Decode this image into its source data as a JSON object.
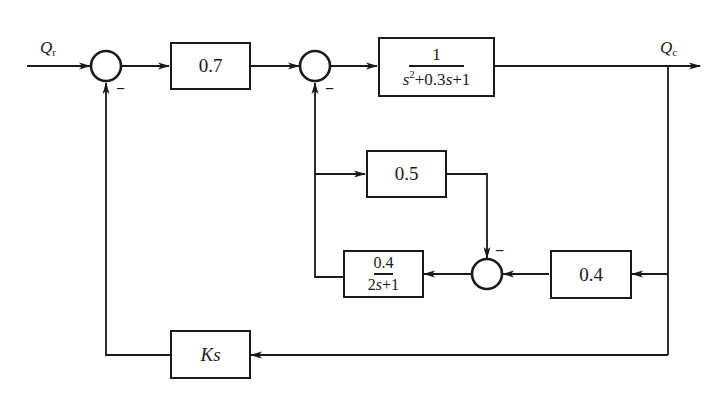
{
  "diagram": {
    "type": "control-system-block-diagram",
    "signals": {
      "input": {
        "symbol": "Q",
        "subscript": "r"
      },
      "output": {
        "symbol": "Q",
        "subscript": "c"
      }
    },
    "blocks": {
      "forward_gain": {
        "label": "0.7"
      },
      "plant": {
        "numerator": "1",
        "denominator_parts": [
          "s",
          "2",
          "+0.3",
          "s",
          "+1"
        ]
      },
      "inner_gain": {
        "label": "0.5"
      },
      "lag": {
        "numerator": "0.4",
        "denominator_parts": [
          "2",
          "s",
          "+1"
        ]
      },
      "output_gain": {
        "label": "0.4"
      },
      "derivative_feedback": {
        "parts": [
          "K",
          "s"
        ]
      }
    },
    "summing_junctions": [
      {
        "id": "sum1",
        "inputs": [
          "Q_r (+)",
          "Ks feedback (−)"
        ],
        "sign_label": "−"
      },
      {
        "id": "sum2",
        "inputs": [
          "0.7 output (+)",
          "0.4/(2s+1) feedback (−)"
        ],
        "sign_label": "−"
      },
      {
        "id": "sum3",
        "inputs": [
          "0.4·Q_c (+)",
          "0.5 branch (−)"
        ],
        "sign_label": "−"
      }
    ],
    "colors": {
      "line": "#1a1a1a",
      "background": "#ffffff"
    }
  }
}
